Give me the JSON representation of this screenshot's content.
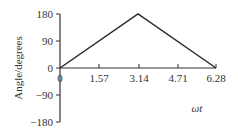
{
  "chart_data": {
    "type": "line",
    "title": "",
    "xlabel": "ωt",
    "ylabel": "Angle/degrees",
    "x_ticks": [
      "0",
      "1.57",
      "3.14",
      "4.71",
      "6.28"
    ],
    "y_ticks": [
      "180",
      "90",
      "0",
      "−90",
      "−180"
    ],
    "xlim": [
      0,
      6.28
    ],
    "ylim": [
      -180,
      180
    ],
    "grid": false,
    "legend": null,
    "series": [
      {
        "name": "angle",
        "x": [
          0,
          3.14,
          6.28
        ],
        "y": [
          0,
          180,
          0
        ]
      }
    ]
  }
}
